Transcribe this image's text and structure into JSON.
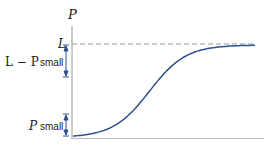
{
  "chart_data": {
    "type": "line",
    "title": "",
    "xlabel": "",
    "ylabel": "P",
    "series": [
      {
        "name": "logistic curve",
        "shape": "sigmoid",
        "color": "#2f4f8f",
        "x": [
          0,
          0.1,
          0.2,
          0.3,
          0.4,
          0.5,
          0.6,
          0.7,
          0.8,
          0.9,
          1.0
        ],
        "y": [
          0.02,
          0.05,
          0.12,
          0.27,
          0.5,
          0.73,
          0.88,
          0.95,
          0.98,
          0.99,
          1.0
        ]
      }
    ],
    "asymptote": {
      "label": "L",
      "value": 1.0,
      "style": "dashed",
      "color": "#999999"
    },
    "annotations": [
      {
        "text_math": "L − P",
        "text": "small",
        "position": "near top, below L"
      },
      {
        "text_math": "P",
        "text": "small",
        "position": "near bottom"
      }
    ],
    "grid": false,
    "legend": "none"
  },
  "labels": {
    "y_axis": "P",
    "asymptote": "L",
    "top_math": "L − P",
    "top_word": "small",
    "bottom_math": "P",
    "bottom_word": "small"
  },
  "colors": {
    "curve": "#2f4f8f",
    "axis": "#aaaaaa",
    "dash": "#999999",
    "arrow": "#2f4f8f"
  }
}
